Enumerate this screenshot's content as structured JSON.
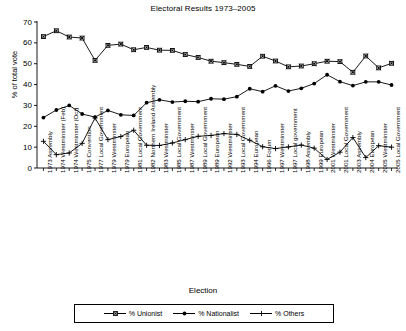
{
  "chart_data": {
    "type": "line",
    "title": "Electoral Results 1973–2005",
    "xlabel": "Election",
    "ylabel": "% of total vote",
    "ylim": [
      0,
      70
    ],
    "yticks": [
      0,
      10,
      20,
      30,
      40,
      50,
      60,
      70
    ],
    "grid": false,
    "legend_position": "bottom",
    "categories": [
      "1973 Assembly",
      "1974 Westminster (Feb)",
      "1974 Westminster (Oct)",
      "1975 Convention",
      "1977 Local Government",
      "1979 Westminster",
      "1979 European",
      "1981 Local Government",
      "1982 Northern Ireland Assembly",
      "1983 Westminster",
      "1985 Local Government",
      "1987 Westminster",
      "1989 Local Government",
      "1989 European",
      "1992 Westminster",
      "1993 Local Government",
      "1994 European",
      "1996 Forum",
      "1997 Westminster",
      "1997 Local government",
      "1998 Assembly",
      "1999 European",
      "2001 Westminster",
      "2001 Local Government",
      "2003 Assembly",
      "2004 European",
      "2005 Westminster",
      "2005 Local Government"
    ],
    "series": [
      {
        "name": "% Unionist",
        "marker": "square",
        "color": "#000000",
        "values": [
          63.0,
          65.8,
          62.8,
          62.3,
          51.6,
          58.8,
          59.4,
          56.7,
          57.8,
          56.5,
          56.4,
          54.4,
          53.0,
          51.2,
          50.5,
          49.7,
          48.7,
          53.6,
          51.3,
          48.5,
          48.9,
          50.0,
          51.2,
          51.0,
          45.9,
          53.7,
          48.0,
          50.2
        ]
      },
      {
        "name": "% Nationalist",
        "marker": "circle",
        "color": "#000000",
        "values": [
          24.2,
          27.8,
          30.0,
          25.9,
          24.4,
          27.6,
          25.5,
          25.2,
          31.3,
          32.7,
          31.6,
          32.0,
          31.8,
          33.2,
          33.0,
          34.2,
          38.0,
          36.6,
          39.4,
          36.9,
          38.2,
          40.5,
          44.7,
          41.4,
          39.5,
          41.3,
          41.3,
          39.8
        ]
      },
      {
        "name": "% Others",
        "marker": "plus",
        "color": "#000000",
        "values": [
          12.8,
          6.4,
          7.2,
          11.8,
          24.0,
          13.6,
          15.1,
          18.1,
          10.9,
          10.8,
          12.0,
          13.6,
          15.2,
          15.6,
          16.5,
          16.1,
          13.3,
          10.2,
          9.3,
          10.1,
          11.0,
          9.5,
          4.1,
          7.6,
          14.6,
          5.0,
          10.7,
          10.0
        ]
      }
    ]
  }
}
